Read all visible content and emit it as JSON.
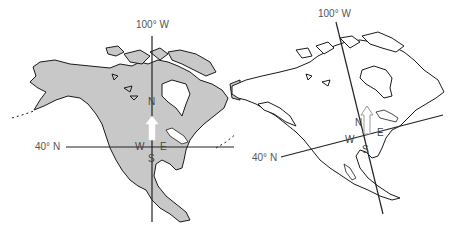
{
  "maps": [
    {
      "id": "left",
      "projection": "standard (north-up)",
      "fill": "#c8c8c8",
      "meridian_label": "100° W",
      "parallel_label": "40° N",
      "compass": {
        "n": "N",
        "s": "S",
        "e": "E",
        "w": "W"
      },
      "north_arrow_fill": "#ffffff"
    },
    {
      "id": "right",
      "projection": "rotated / oblique",
      "fill": "#ffffff",
      "meridian_label": "100° W",
      "parallel_label": "40° N",
      "compass": {
        "n": "N",
        "s": "S",
        "e": "E",
        "w": "W"
      },
      "north_arrow_fill": "#ffffff"
    }
  ],
  "colors": {
    "land_shaded": "#c8c8c8",
    "outline": "#1a1a1a",
    "line": "#222222",
    "text": "#555555"
  }
}
